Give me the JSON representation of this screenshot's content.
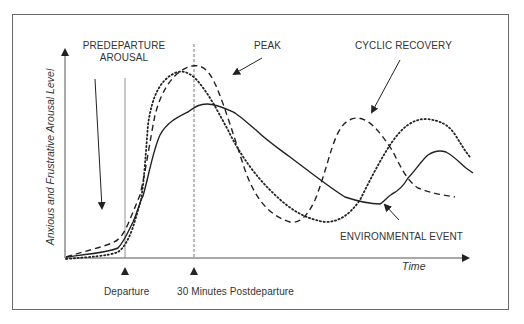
{
  "diagram": {
    "y_axis_label": "Anxious and Frustrative Arousal Level",
    "x_axis_label": "Time",
    "annotations": {
      "predeparture_line1": "PREDEPARTURE",
      "predeparture_line2": "AROUSAL",
      "peak": "PEAK",
      "cyclic_recovery": "CYCLIC RECOVERY",
      "environmental_event": "ENVIRONMENTAL EVENT"
    },
    "markers": {
      "departure": "Departure",
      "postdeparture": "30 Minutes Postdeparture"
    },
    "series": [
      {
        "name": "solid",
        "style": "solid"
      },
      {
        "name": "dashed",
        "style": "dashed"
      },
      {
        "name": "dotted",
        "style": "dotted"
      }
    ],
    "colors": {
      "line": "#222222",
      "frame": "#6a6a6a",
      "text": "#333333"
    }
  }
}
